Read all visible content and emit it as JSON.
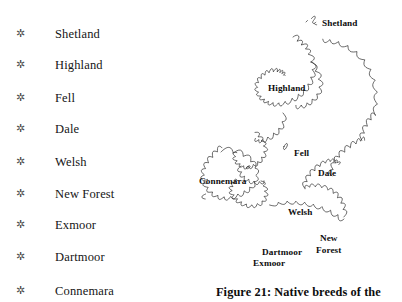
{
  "page": {
    "background_color": "#ffffff",
    "text_color": "#151515"
  },
  "breed_list": {
    "bullet_glyph": "✲",
    "items": [
      {
        "label": "Shetland",
        "top": 25
      },
      {
        "label": "Highland",
        "top": 56
      },
      {
        "label": "Fell",
        "top": 89
      },
      {
        "label": "Dale",
        "top": 120
      },
      {
        "label": "Welsh",
        "top": 153
      },
      {
        "label": "New Forest",
        "top": 185
      },
      {
        "label": "Exmoor",
        "top": 216
      },
      {
        "label": "Dartmoor",
        "top": 248
      },
      {
        "label": "Connemara",
        "top": 282
      }
    ]
  },
  "map": {
    "outline_color": "#2b2b2b",
    "fill_color": "#ffffff",
    "labels": [
      {
        "text": "Shetland",
        "left": 137,
        "top": 18
      },
      {
        "text": "Highland",
        "left": 83,
        "top": 83
      },
      {
        "text": "Fell",
        "left": 109,
        "top": 148
      },
      {
        "text": "Dale",
        "left": 133,
        "top": 168
      },
      {
        "text": "Connemara",
        "left": 14,
        "top": 176
      },
      {
        "text": "Welsh",
        "left": 103,
        "top": 207
      },
      {
        "text": "Dartmoor",
        "left": 77,
        "top": 247
      },
      {
        "text": "Exmoor",
        "left": 68,
        "top": 258
      }
    ],
    "new_forest_label": {
      "line1": "New",
      "line2": "Forest",
      "left": 131,
      "top": 233
    }
  },
  "caption": {
    "text": "Figure 21: Native breeds of the"
  }
}
